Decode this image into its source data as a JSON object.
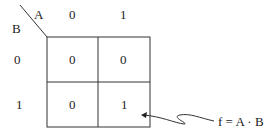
{
  "kmap": {
    "var_col": "A",
    "var_row": "B",
    "col_headers": [
      "0",
      "1"
    ],
    "row_headers": [
      "0",
      "1"
    ],
    "cells": [
      [
        "0",
        "0"
      ],
      [
        "0",
        "1"
      ]
    ]
  },
  "annotation": {
    "text": "f = A · B"
  }
}
